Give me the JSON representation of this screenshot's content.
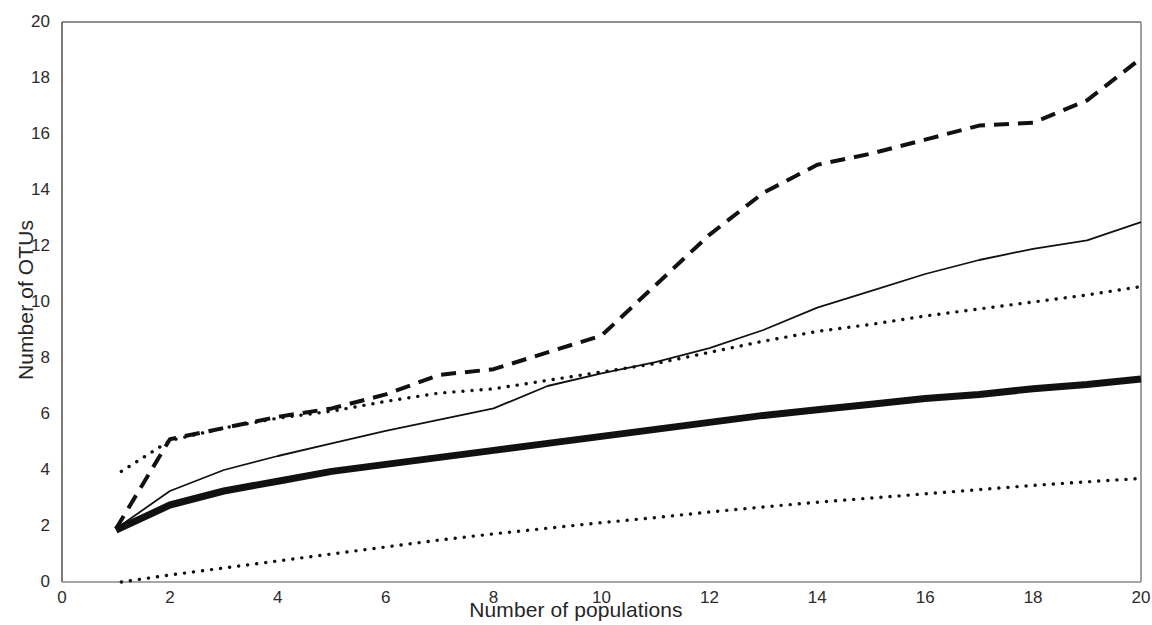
{
  "chart_data": {
    "type": "line",
    "title": "",
    "subtitle": "",
    "xlabel": "Number of populations",
    "ylabel": "Number of OTUs",
    "xlim": [
      0,
      20
    ],
    "ylim": [
      0,
      20
    ],
    "xticks": [
      0,
      2,
      4,
      6,
      8,
      10,
      12,
      14,
      16,
      18,
      20
    ],
    "yticks": [
      0,
      2,
      4,
      6,
      8,
      10,
      12,
      14,
      16,
      18,
      20
    ],
    "xtick_labels": [
      "0",
      "2",
      "4",
      "6",
      "8",
      "10",
      "12",
      "14",
      "16",
      "18",
      "20"
    ],
    "ytick_labels": [
      "0",
      "2",
      "4",
      "6",
      "8",
      "10",
      "12",
      "14",
      "16",
      "18",
      "20"
    ],
    "grid": false,
    "legend": "none",
    "color": "#111111",
    "x": [
      1,
      2,
      3,
      4,
      5,
      6,
      7,
      8,
      9,
      10,
      11,
      12,
      13,
      14,
      15,
      16,
      17,
      18,
      19,
      20
    ],
    "series": [
      {
        "name": "dashed-accumulation",
        "style": "dashed",
        "linewidth": 4,
        "x": [
          1,
          2,
          3,
          4,
          5,
          6,
          7,
          8,
          9,
          10,
          11,
          12,
          13,
          14,
          15,
          16,
          17,
          18,
          19,
          20
        ],
        "values": [
          1.9,
          5.1,
          5.5,
          5.9,
          6.2,
          6.7,
          7.4,
          7.6,
          8.2,
          8.8,
          10.6,
          12.4,
          13.9,
          14.9,
          15.3,
          15.8,
          16.3,
          16.4,
          17.2,
          18.7
        ]
      },
      {
        "name": "thin-solid-accumulation",
        "style": "solid",
        "linewidth": 1.8,
        "x": [
          1,
          2,
          3,
          4,
          5,
          6,
          7,
          8,
          9,
          10,
          11,
          12,
          13,
          14,
          15,
          16,
          17,
          18,
          19,
          20
        ],
        "values": [
          1.9,
          3.25,
          4.0,
          4.5,
          4.95,
          5.4,
          5.8,
          6.2,
          7.0,
          7.45,
          7.85,
          8.35,
          9.0,
          9.8,
          10.4,
          11.0,
          11.5,
          11.9,
          12.2,
          12.85
        ]
      },
      {
        "name": "upper-dotted-reference",
        "style": "dotted",
        "linewidth": 3.4,
        "x": [
          1.1,
          2,
          3,
          4,
          5,
          6,
          7,
          8,
          9,
          10,
          11,
          12,
          13,
          14,
          15,
          16,
          17,
          18,
          19,
          20
        ],
        "values": [
          3.95,
          5.05,
          5.5,
          5.85,
          6.1,
          6.45,
          6.75,
          6.9,
          7.2,
          7.5,
          7.8,
          8.2,
          8.6,
          8.95,
          9.2,
          9.5,
          9.75,
          10.0,
          10.25,
          10.55
        ]
      },
      {
        "name": "thick-solid-accumulation",
        "style": "solid",
        "linewidth": 7,
        "x": [
          1,
          2,
          3,
          4,
          5,
          6,
          7,
          8,
          9,
          10,
          11,
          12,
          13,
          14,
          15,
          16,
          17,
          18,
          19,
          20
        ],
        "values": [
          1.85,
          2.75,
          3.25,
          3.6,
          3.95,
          4.2,
          4.45,
          4.7,
          4.95,
          5.2,
          5.45,
          5.7,
          5.95,
          6.15,
          6.35,
          6.55,
          6.7,
          6.9,
          7.05,
          7.25
        ]
      },
      {
        "name": "lower-dotted-reference",
        "style": "dotted",
        "linewidth": 3.4,
        "x": [
          1.1,
          2,
          3,
          4,
          5,
          6,
          7,
          8,
          9,
          10,
          11,
          12,
          13,
          14,
          15,
          16,
          17,
          18,
          19,
          20
        ],
        "values": [
          0.0,
          0.25,
          0.5,
          0.75,
          1.0,
          1.25,
          1.5,
          1.72,
          1.92,
          2.12,
          2.3,
          2.5,
          2.68,
          2.85,
          3.0,
          3.15,
          3.3,
          3.45,
          3.58,
          3.7
        ]
      }
    ]
  },
  "axes": {
    "xlabel": "Number of populations",
    "ylabel": "Number of OTUs"
  }
}
